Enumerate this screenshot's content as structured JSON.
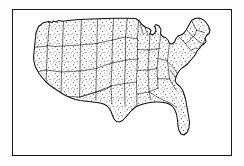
{
  "figure": {
    "kind": "line-art map illustration",
    "title": "",
    "caption": "",
    "has_visible_text": false,
    "style": "black-and-white engraved / stippled clip-art, scanned",
    "frame": {
      "present": true,
      "shape": "rectangle",
      "stroke_color": "#1a1a1a",
      "fill_color": "#ffffff"
    },
    "background_color": "#fdfdfd",
    "line_color": "#111111",
    "state_border_color": "#1b1b1b",
    "stipple_color": "#222222"
  },
  "map": {
    "region": "Contiguous United States (lower 48)",
    "projection_look": "simplified planar outline",
    "shows_state_boundaries": true,
    "shows_labels": false,
    "shows_legend": false,
    "shows_compass": false,
    "shows_scalebar": false,
    "fill_pattern": "stipple dots",
    "excluded_regions": [
      "Alaska",
      "Hawaii"
    ],
    "notable_features": [
      "West Coast with California bight",
      "Pacific Northwest",
      "Great Lakes indentation",
      "Michigan Lower Peninsula",
      "Gulf of Mexico coastline",
      "Texas panhandle and Gulf coast",
      "Florida peninsula",
      "Atlantic seaboard",
      "Cape Cod and New England",
      "Maine in the far northeast"
    ],
    "state_count": 48
  },
  "colors": {
    "ink": "#111111",
    "paper": "#ffffff",
    "page": "#fdfdfd",
    "stipple": "#222222"
  }
}
